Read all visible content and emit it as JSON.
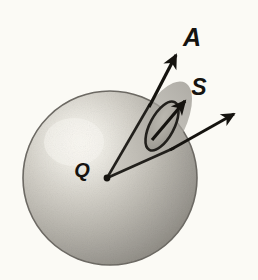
{
  "figure": {
    "background_color": "#fbfaf5",
    "ink_color": "#15130f",
    "labels": {
      "vector_a": "A",
      "vector_s": "S",
      "point_q": "Q"
    },
    "sphere": {
      "name": "shaded-sphere",
      "center_x": 110,
      "center_y": 178,
      "radius": 87,
      "highlight_x": 72,
      "highlight_y": 140,
      "light_color": "#faf8f2",
      "mid_color": "#b9b6ae",
      "dark_color": "#86837c",
      "edge_color": "#6e6b65"
    },
    "patch": {
      "name": "surface-patch-s",
      "center_x": 162,
      "center_y": 126,
      "rx": 12,
      "ry": 27,
      "rotation_deg": 28,
      "fill_color": "#a09d95",
      "stroke_color": "#22201c"
    },
    "cone": {
      "name": "solid-angle-cone",
      "apex_x": 107,
      "apex_y": 178,
      "fill_color": "#aaa7a0",
      "stroke_color": "#22201c"
    },
    "vectors": [
      {
        "name": "vector-a-arrow",
        "label": "A",
        "from_x": 107,
        "from_y": 178,
        "to_x": 178,
        "to_y": 52,
        "label_x": 192,
        "label_y": 46,
        "stroke_width": 3.2
      },
      {
        "name": "vector-s-arrow",
        "label": "S",
        "from_x": 152,
        "from_y": 140,
        "to_x": 187,
        "to_y": 99,
        "label_x": 199,
        "label_y": 95,
        "stroke_width": 3.2
      },
      {
        "name": "cone-lower-edge-arrow",
        "label": "",
        "from_x": 107,
        "from_y": 178,
        "to_x": 237,
        "to_y": 112,
        "label_x": 0,
        "label_y": 0,
        "stroke_width": 3.0
      }
    ],
    "point_marker": {
      "name": "point-q-vertex",
      "x": 107,
      "y": 178,
      "label_x": 82,
      "label_y": 170
    }
  }
}
